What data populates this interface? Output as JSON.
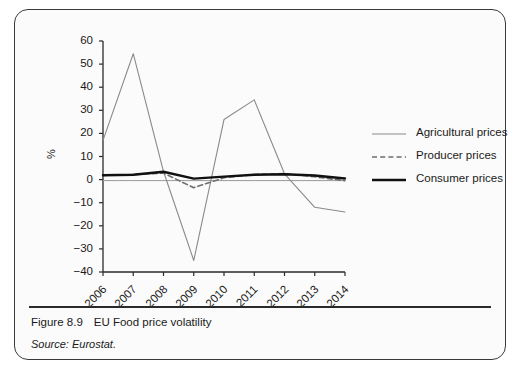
{
  "figure": {
    "number": "Figure 8.9",
    "title": "EU Food price volatility",
    "source": "Source: Eurostat."
  },
  "chart_data": {
    "type": "line",
    "title": "EU Food price volatility",
    "xlabel": "",
    "ylabel": "%",
    "categories": [
      "2006",
      "2007",
      "2008",
      "2009",
      "2010",
      "2011",
      "2012",
      "2013",
      "2014"
    ],
    "ylim": [
      -40,
      60
    ],
    "ytick_values": [
      60,
      50,
      40,
      30,
      20,
      10,
      0,
      -10,
      -20,
      -30,
      -40
    ],
    "ytick_labels": [
      "60",
      "50",
      "40",
      "30",
      "20",
      "10",
      "0",
      "−10",
      "−20",
      "−30",
      "−40"
    ],
    "grid": false,
    "legend_position": "right",
    "series": [
      {
        "name": "Agricultural prices",
        "style": "solid-thin",
        "color": "#8a8a8a",
        "values": [
          17,
          54.5,
          3.5,
          -35,
          26,
          34.5,
          2.5,
          -12,
          -14
        ]
      },
      {
        "name": "Producer prices",
        "style": "dashed",
        "color": "#6e6e6e",
        "values": [
          1.8,
          2.2,
          2.8,
          -3.5,
          0.8,
          2.2,
          2.6,
          1.2,
          -0.5
        ]
      },
      {
        "name": "Consumer prices",
        "style": "solid-thick",
        "color": "#111111",
        "values": [
          1.9,
          2.1,
          3.4,
          0.4,
          1.3,
          2.1,
          2.3,
          1.8,
          0.5
        ]
      }
    ]
  },
  "legend": {
    "items": [
      {
        "label": "Agricultural prices"
      },
      {
        "label": "Producer prices"
      },
      {
        "label": "Consumer prices"
      }
    ]
  },
  "colors": {
    "agricultural": "#8a8a8a",
    "producer": "#6e6e6e",
    "consumer": "#111111",
    "axis": "#2a2a2a",
    "card_border": "#3a3a3a",
    "card_background": "#fbfbfb"
  }
}
